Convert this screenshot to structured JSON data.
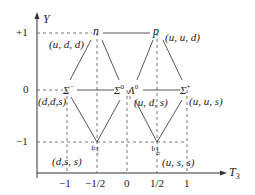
{
  "axes": {
    "y_label": "Y",
    "x_label": "T",
    "x_label_sub": "3",
    "y_ticks": [
      "+1",
      "0",
      "−1"
    ],
    "x_ticks": [
      "−1",
      "−1/2",
      "0",
      "1/2",
      "1"
    ]
  },
  "particles": {
    "n": {
      "name": "n",
      "quarks": "(u, d, d)"
    },
    "p": {
      "name": "p",
      "quarks": "(u, u, d)"
    },
    "sigma_minus": {
      "name": "Σ",
      "sup": "−",
      "quarks": "(d,d,s)"
    },
    "sigma_zero": {
      "name": "Σ",
      "sup": "0"
    },
    "lambda_zero": {
      "name": "Λ",
      "sup": "0",
      "quarks": "(u, d, s)"
    },
    "sigma_plus": {
      "name": "Σ",
      "sup": "+",
      "quarks": "(u, u, s)"
    },
    "xi_minus": {
      "name": "Ξ",
      "sup": "−",
      "quarks": "(d,s, s)"
    },
    "xi_zero": {
      "name": "Ξ",
      "sup": "0",
      "quarks": "(u, s, s)"
    }
  }
}
